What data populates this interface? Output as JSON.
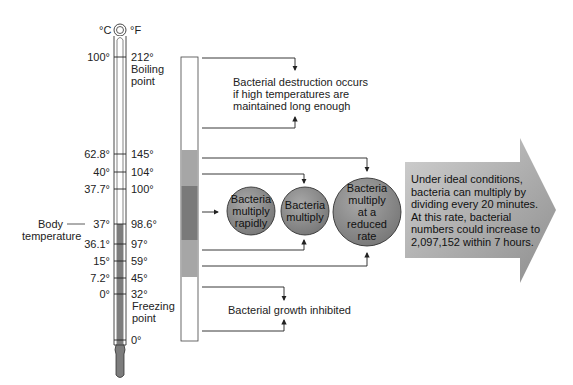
{
  "thermometer": {
    "unit_c": "°C",
    "unit_f": "°F",
    "ticks": [
      {
        "c": "100°",
        "f": "212°",
        "note": "Boiling\npoint",
        "y": 57
      },
      {
        "c": "62.8°",
        "f": "145°",
        "y": 154
      },
      {
        "c": "40°",
        "f": "104°",
        "y": 172
      },
      {
        "c": "37.7°",
        "f": "100°",
        "y": 189
      },
      {
        "c": "37°",
        "f": "98.6°",
        "y": 224
      },
      {
        "c": "36.1°",
        "f": "97°",
        "y": 244
      },
      {
        "c": "15°",
        "f": "59°",
        "y": 261
      },
      {
        "c": "7.2°",
        "f": "45°",
        "y": 278
      },
      {
        "c": "0°",
        "f": "32°",
        "note": "Freezing\npoint",
        "y": 294
      },
      {
        "c": "",
        "f": "0°",
        "y": 340
      }
    ],
    "body_temperature_label": "Body\ntemperature",
    "boiling_label_1": "Boiling",
    "boiling_label_2": "point",
    "freezing_label_1": "Freezing",
    "freezing_label_2": "point",
    "body_label_1": "Body",
    "body_label_2": "temperature"
  },
  "zones": {
    "destruction": "Bacterial destruction occurs\nif high temperatures are\nmaintained long enough",
    "destruction_lines": [
      "Bacterial destruction occurs",
      "if high temperatures are",
      "maintained long enough"
    ],
    "inhibited": "Bacterial growth inhibited"
  },
  "circles": [
    {
      "lines": [
        "Bacteria",
        "multiply",
        "rapidly"
      ]
    },
    {
      "lines": [
        "Bacteria",
        "multiply"
      ]
    },
    {
      "lines": [
        "Bacteria",
        "multiply",
        "at a",
        "reduced",
        "rate"
      ]
    }
  ],
  "callout": {
    "lines": [
      "Under ideal conditions,",
      "bacteria can multiply by",
      "dividing every 20 minutes.",
      "At this rate, bacterial",
      "numbers could increase to",
      "2,097,152 within 7 hours."
    ]
  },
  "colors": {
    "bar_mid": "#a6a6a6",
    "bar_dark": "#7a7a7a",
    "circle_fill": "#8c8c8c",
    "arrow_fill": "#b0b0b0",
    "mercury": "#7d7d7d"
  }
}
